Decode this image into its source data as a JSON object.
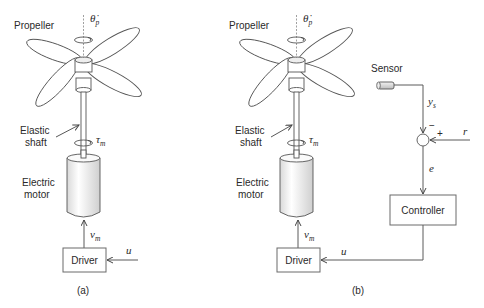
{
  "panels": {
    "a": {
      "caption": "(a)",
      "propeller_label": "Propeller",
      "propeller_speed_symbol": "θ̇",
      "propeller_speed_sub": "p",
      "shaft_label_line1": "Elastic",
      "shaft_label_line2": "shaft",
      "torque_symbol": "τ",
      "torque_sub": "m",
      "motor_label_line1": "Electric",
      "motor_label_line2": "motor",
      "voltage_symbol": "v",
      "voltage_sub": "m",
      "driver_label": "Driver",
      "input_symbol": "u"
    },
    "b": {
      "caption": "(b)",
      "propeller_label": "Propeller",
      "propeller_speed_symbol": "θ̇",
      "propeller_speed_sub": "p",
      "shaft_label_line1": "Elastic",
      "shaft_label_line2": "shaft",
      "torque_symbol": "τ",
      "torque_sub": "m",
      "motor_label_line1": "Electric",
      "motor_label_line2": "motor",
      "voltage_symbol": "v",
      "voltage_sub": "m",
      "driver_label": "Driver",
      "control_signal_symbol": "u",
      "sensor_label": "Sensor",
      "sensor_output_symbol": "y",
      "sensor_output_sub": "s",
      "minus_sign": "−",
      "plus_sign": "+",
      "reference_symbol": "r",
      "error_symbol": "e",
      "controller_label": "Controller"
    }
  },
  "colors": {
    "stroke": "#5a5a5a",
    "text": "#2a2a2a",
    "motor_fill_light": "#fafafa",
    "motor_fill_dark": "#d8d8d8",
    "sensor_fill": "#cfcfcf"
  }
}
